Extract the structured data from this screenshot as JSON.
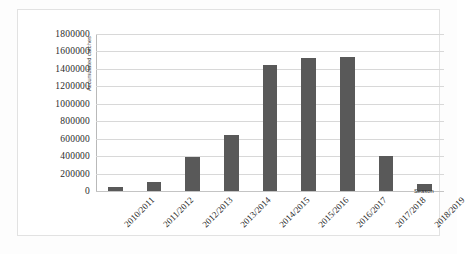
{
  "chart_data": {
    "type": "bar",
    "title": "",
    "subtitle": "",
    "xlabel": "Season",
    "ylabel": "Accumulated catches",
    "categories": [
      "2010/2011",
      "2011/2012",
      "2012/2013",
      "2013/2014",
      "2014/2015",
      "2015/2016",
      "2016/2017",
      "2017/2018",
      "2018/2019"
    ],
    "values": [
      50000,
      100000,
      390000,
      640000,
      1450000,
      1520000,
      1540000,
      400000,
      80000
    ],
    "ylim": [
      0,
      1800000
    ],
    "ytick_values": [
      0,
      200000,
      400000,
      600000,
      800000,
      1000000,
      1200000,
      1400000,
      1600000,
      1800000
    ],
    "ytick_labels": [
      "0",
      "200000",
      "400000",
      "600000",
      "800000",
      "1000000",
      "1200000",
      "1400000",
      "1600000",
      "1800000"
    ],
    "grid": true,
    "grid_axis": "y",
    "legend": false,
    "legend_position": "none",
    "bar_color": "#595959",
    "gridline_color": "#d8d8d8",
    "background_color": "#ffffff"
  }
}
